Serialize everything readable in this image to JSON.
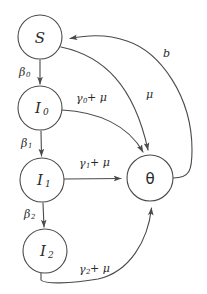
{
  "diagram": {
    "stroke_color": "#4a4a4a",
    "text_color": "#2b2b2b",
    "background_color": "#ffffff",
    "nodes": [
      {
        "id": "S",
        "label": "S",
        "sub": "",
        "cx": 40,
        "cy": 37,
        "r": 22
      },
      {
        "id": "I0",
        "label": "I",
        "sub": "0",
        "cx": 40,
        "cy": 108,
        "r": 22
      },
      {
        "id": "I1",
        "label": "I",
        "sub": "1",
        "cx": 42,
        "cy": 180,
        "r": 22
      },
      {
        "id": "I2",
        "label": "I",
        "sub": "2",
        "cx": 45,
        "cy": 251,
        "r": 22
      },
      {
        "id": "theta",
        "label": "θ",
        "sub": "",
        "cx": 150,
        "cy": 178,
        "r": 23
      }
    ],
    "edges": [
      {
        "id": "S-I0",
        "from": "S",
        "to": "I0",
        "label": "β",
        "sub": "0",
        "suffix": "",
        "label_x": 19,
        "label_y": 72
      },
      {
        "id": "I0-I1",
        "from": "I0",
        "to": "I1",
        "label": "β",
        "sub": "1",
        "suffix": "",
        "label_x": 21,
        "label_y": 143
      },
      {
        "id": "I1-I2",
        "from": "I1",
        "to": "I2",
        "label": "β",
        "sub": "2",
        "suffix": "",
        "label_x": 24,
        "label_y": 214
      },
      {
        "id": "I0-theta",
        "from": "I0",
        "to": "theta",
        "label": "γ",
        "sub": "0",
        "suffix": "+ μ",
        "label_x": 76,
        "label_y": 98
      },
      {
        "id": "I1-theta",
        "from": "I1",
        "to": "theta",
        "label": "γ",
        "sub": "1",
        "suffix": "+ μ",
        "label_x": 79,
        "label_y": 163
      },
      {
        "id": "I2-theta",
        "from": "I2",
        "to": "theta",
        "label": "γ",
        "sub": "2",
        "suffix": "+ μ",
        "label_x": 79,
        "label_y": 269
      },
      {
        "id": "S-theta",
        "from": "S",
        "to": "theta",
        "label": "μ",
        "sub": "",
        "suffix": "",
        "label_x": 148,
        "label_y": 94
      },
      {
        "id": "theta-S",
        "from": "theta",
        "to": "S",
        "label": "b",
        "sub": "",
        "suffix": "",
        "label_x": 165,
        "label_y": 53
      }
    ]
  }
}
